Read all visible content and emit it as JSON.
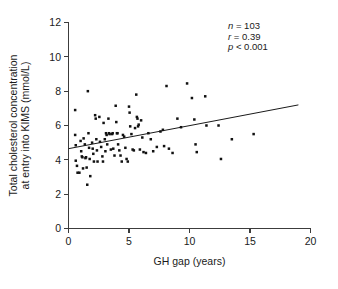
{
  "chart_data": {
    "type": "scatter",
    "title": "",
    "xlabel": "GH gap (years)",
    "ylabel_line1": "Total cholesterol concentration",
    "ylabel_line2": "at entry into KIMS (mmol/L)",
    "xlim": [
      0,
      20
    ],
    "ylim": [
      0,
      12
    ],
    "xticks": [
      0,
      5,
      10,
      15,
      20
    ],
    "xtick_labels": [
      "0",
      "5",
      "10",
      "15",
      "20"
    ],
    "yticks": [
      0,
      2,
      4,
      6,
      8,
      10,
      12
    ],
    "ytick_labels": [
      "0",
      "2",
      "4",
      "6",
      "8",
      "10",
      "12"
    ],
    "grid": false,
    "legend": "none",
    "marker": "filled-square",
    "marker_color": "#111111",
    "annotations": [
      {
        "name": "sample-size",
        "symbol": "n",
        "relation": "=",
        "value": "103",
        "text": "n = 103"
      },
      {
        "name": "correlation-coefficient",
        "symbol": "r",
        "relation": "=",
        "value": "0.39",
        "text": "r = 0.39"
      },
      {
        "name": "p-value",
        "symbol": "p",
        "relation": "<",
        "value": "0.001",
        "text": "p < 0.001"
      }
    ],
    "fit_line": {
      "name": "regression-line",
      "x_start": 0.0,
      "y_start": 4.65,
      "x_end": 19.0,
      "y_end": 7.2,
      "slope": 0.134,
      "intercept": 4.65
    },
    "points": [
      [
        0.55,
        6.9
      ],
      [
        0.55,
        5.45
      ],
      [
        0.6,
        4.85
      ],
      [
        0.6,
        3.95
      ],
      [
        0.7,
        3.65
      ],
      [
        0.75,
        3.25
      ],
      [
        0.9,
        3.25
      ],
      [
        1.0,
        5.1
      ],
      [
        1.05,
        4.5
      ],
      [
        1.1,
        4.2
      ],
      [
        1.15,
        4.15
      ],
      [
        1.2,
        3.5
      ],
      [
        1.25,
        5.25
      ],
      [
        1.35,
        4.9
      ],
      [
        1.4,
        4.1
      ],
      [
        1.45,
        4.15
      ],
      [
        1.5,
        3.55
      ],
      [
        1.55,
        2.55
      ],
      [
        1.6,
        8.0
      ],
      [
        1.65,
        5.55
      ],
      [
        1.7,
        4.7
      ],
      [
        1.75,
        4.05
      ],
      [
        1.8,
        3.05
      ],
      [
        1.95,
        5.0
      ],
      [
        2.0,
        4.65
      ],
      [
        2.05,
        4.35
      ],
      [
        2.1,
        3.9
      ],
      [
        2.2,
        6.6
      ],
      [
        2.25,
        6.4
      ],
      [
        2.3,
        5.2
      ],
      [
        2.35,
        4.55
      ],
      [
        2.4,
        3.9
      ],
      [
        2.55,
        6.5
      ],
      [
        2.6,
        5.05
      ],
      [
        2.7,
        4.75
      ],
      [
        2.8,
        4.2
      ],
      [
        2.85,
        3.9
      ],
      [
        2.9,
        6.15
      ],
      [
        3.0,
        5.2
      ],
      [
        3.05,
        4.5
      ],
      [
        3.1,
        5.55
      ],
      [
        3.15,
        5.45
      ],
      [
        3.2,
        4.9
      ],
      [
        3.3,
        6.4
      ],
      [
        3.35,
        5.55
      ],
      [
        3.4,
        5.5
      ],
      [
        3.5,
        4.6
      ],
      [
        3.6,
        5.5
      ],
      [
        3.65,
        5.55
      ],
      [
        3.7,
        4.65
      ],
      [
        3.8,
        4.25
      ],
      [
        3.9,
        7.15
      ],
      [
        3.95,
        6.2
      ],
      [
        4.0,
        5.55
      ],
      [
        4.05,
        5.55
      ],
      [
        4.1,
        4.9
      ],
      [
        4.2,
        4.55
      ],
      [
        4.3,
        4.25
      ],
      [
        4.4,
        3.9
      ],
      [
        4.5,
        5.45
      ],
      [
        4.6,
        5.35
      ],
      [
        4.7,
        4.7
      ],
      [
        4.8,
        4.05
      ],
      [
        4.9,
        3.9
      ],
      [
        5.0,
        7.1
      ],
      [
        5.05,
        6.75
      ],
      [
        5.1,
        5.95
      ],
      [
        5.2,
        5.5
      ],
      [
        5.3,
        4.6
      ],
      [
        5.4,
        4.55
      ],
      [
        5.5,
        5.85
      ],
      [
        5.6,
        7.8
      ],
      [
        5.65,
        6.5
      ],
      [
        5.7,
        6.4
      ],
      [
        5.75,
        5.95
      ],
      [
        5.8,
        6.05
      ],
      [
        5.9,
        4.6
      ],
      [
        6.0,
        6.3
      ],
      [
        6.1,
        5.3
      ],
      [
        6.2,
        4.45
      ],
      [
        6.4,
        4.4
      ],
      [
        6.6,
        5.55
      ],
      [
        6.8,
        5.2
      ],
      [
        7.0,
        4.5
      ],
      [
        7.3,
        4.75
      ],
      [
        7.6,
        5.65
      ],
      [
        7.8,
        5.75
      ],
      [
        7.9,
        4.8
      ],
      [
        8.1,
        8.3
      ],
      [
        8.3,
        4.65
      ],
      [
        8.6,
        4.4
      ],
      [
        9.0,
        6.4
      ],
      [
        9.3,
        5.9
      ],
      [
        9.8,
        8.45
      ],
      [
        10.2,
        7.6
      ],
      [
        10.4,
        6.35
      ],
      [
        10.5,
        4.9
      ],
      [
        10.6,
        4.45
      ],
      [
        11.3,
        7.7
      ],
      [
        11.4,
        6.0
      ],
      [
        12.4,
        6.0
      ],
      [
        12.6,
        4.05
      ],
      [
        13.5,
        5.2
      ],
      [
        15.3,
        5.5
      ]
    ]
  }
}
